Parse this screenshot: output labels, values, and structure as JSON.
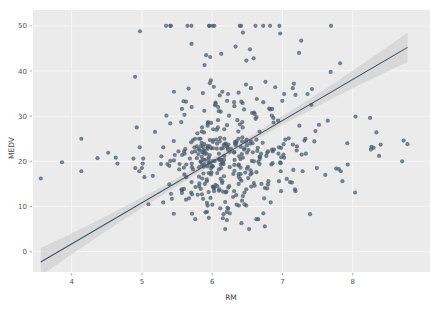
{
  "figure": {
    "background_color": "#ffffff",
    "plot_background_color": "#ebebeb",
    "gridline_color": "#f7f7f7",
    "point_color": "#4c5c6b",
    "line_color": "#45535f",
    "band_color": "#c9c9c9",
    "width": 430,
    "height": 309
  },
  "chart_data": {
    "type": "scatter",
    "title": "",
    "subtitle": "",
    "xlabel": "RM",
    "ylabel": "MEDV",
    "xlim": [
      3.45,
      9.1
    ],
    "ylim": [
      -4.5,
      53.5
    ],
    "xticks": [
      4,
      5,
      6,
      7,
      8
    ],
    "xticklabels": [
      "4",
      "5",
      "6",
      "7",
      "8"
    ],
    "yticks": [
      0,
      10,
      20,
      30,
      40,
      50
    ],
    "yticklabels": [
      "0",
      "10",
      "20",
      "30",
      "40",
      "50"
    ],
    "grid": true,
    "legend": "none",
    "regression": {
      "type": "linear",
      "slope": 9.1,
      "intercept": -34.67,
      "confidence_band": 0.95,
      "band_half_width_at_xmin": 3.1,
      "band_half_width_at_center": 0.75,
      "band_half_width_at_xmax": 3.3,
      "x_start": 3.56,
      "x_end": 8.78
    },
    "point_opacity": 0.75,
    "point_radius": 2.1,
    "n_points": 506,
    "x": [
      6.575,
      6.421,
      7.185,
      6.998,
      7.147,
      6.43,
      6.012,
      6.172,
      5.631,
      6.004,
      6.377,
      6.009,
      5.889,
      5.949,
      6.096,
      5.834,
      5.935,
      5.99,
      5.456,
      5.727,
      5.57,
      5.965,
      6.142,
      5.813,
      5.924,
      5.599,
      5.813,
      6.047,
      6.495,
      6.674,
      5.713,
      6.072,
      5.95,
      5.701,
      6.096,
      5.933,
      5.841,
      5.85,
      5.966,
      6.595,
      7.024,
      6.674,
      6.43,
      6.012,
      6.172,
      5.631,
      6.004,
      6.377,
      6.009,
      5.889,
      5.949,
      6.096,
      5.834,
      5.935,
      5.99,
      5.456,
      5.727,
      5.57,
      5.965,
      6.142,
      5.813,
      5.924,
      5.599,
      5.813,
      6.047,
      6.495,
      6.674,
      5.713,
      6.072,
      5.95,
      5.701,
      6.096,
      5.933,
      5.841,
      5.85,
      5.966,
      6.595,
      7.024,
      6.77,
      6.169,
      6.211,
      6.069,
      6.63,
      6.458,
      6.326,
      6.372,
      5.822,
      5.757,
      6.335,
      5.942,
      6.454,
      5.857,
      6.151,
      6.174,
      5.019,
      5.403,
      5.468,
      4.903,
      6.13,
      5.628,
      4.926,
      5.186,
      5.597,
      6.122,
      5.404,
      5.012,
      5.709,
      6.129,
      6.152,
      5.272,
      6.943,
      6.066,
      6.51,
      6.25,
      7.489,
      7.802,
      8.375,
      5.854,
      6.101,
      7.929,
      5.877,
      6.319,
      6.402,
      5.875,
      5.88,
      5.572,
      6.416,
      5.859,
      6.546,
      6.02,
      6.315,
      6.86,
      6.98,
      7.765,
      6.144,
      7.155,
      6.563,
      5.604,
      6.153,
      7.831,
      6.782,
      6.556,
      7.185,
      6.951,
      6.739,
      7.178,
      6.8,
      6.604,
      7.287,
      7.107,
      7.274,
      6.975,
      7.135,
      6.162,
      7.61,
      7.853,
      8.034,
      5.891,
      6.326,
      5.783,
      6.064,
      5.344,
      5.96,
      5.404,
      5.807,
      6.375,
      5.412,
      6.182,
      5.888,
      6.642,
      5.951,
      6.373,
      6.951,
      6.164,
      6.879,
      6.618,
      8.266,
      8.725,
      8.04,
      7.163,
      7.686,
      6.552,
      5.981,
      7.412,
      8.337,
      8.247,
      6.726,
      6.086,
      6.631,
      7.358,
      6.481,
      6.606,
      6.897,
      6.095,
      6.358,
      6.393,
      5.593,
      5.605,
      6.108,
      6.226,
      6.433,
      6.718,
      6.487,
      6.438,
      6.957,
      8.259,
      6.108,
      5.876,
      7.454,
      8.704,
      7.333,
      6.842,
      7.203,
      7.52,
      8.398,
      7.327,
      7.206,
      5.56,
      7.014,
      8.297,
      7.47,
      5.92,
      5.856,
      6.24,
      6.538,
      7.691,
      6.758,
      6.854,
      7.267,
      6.826,
      6.482,
      6.812,
      7.82,
      6.968,
      7.645,
      7.923,
      7.088,
      6.453,
      6.23,
      6.209,
      6.315,
      6.565,
      6.861,
      7.148,
      6.63,
      6.127,
      6.009,
      6.678,
      6.549,
      5.79,
      6.345,
      7.041,
      6.871,
      6.59,
      6.495,
      6.982,
      7.236,
      6.616,
      7.42,
      6.849,
      6.635,
      5.972,
      4.973,
      6.122,
      6.023,
      6.266,
      6.567,
      5.705,
      5.914,
      5.782,
      6.382,
      6.113,
      6.426,
      6.376,
      6.041,
      5.708,
      6.415,
      6.312,
      6.083,
      5.868,
      6.333,
      6.144,
      5.706,
      6.031,
      6.316,
      6.31,
      6.037,
      5.869,
      5.895,
      6.059,
      5.985,
      5.968,
      7.241,
      6.54,
      6.696,
      6.874,
      6.014,
      5.898,
      6.516,
      6.939,
      6.49,
      6.579,
      5.884,
      6.728,
      5.663,
      5.936,
      6.212,
      6.395,
      6.127,
      6.112,
      6.398,
      6.251,
      5.362,
      5.803,
      8.78,
      3.561,
      4.963,
      3.863,
      4.97,
      6.683,
      7.016,
      6.216,
      5.875,
      4.906,
      4.138,
      7.313,
      6.649,
      6.794,
      6.38,
      6.223,
      6.968,
      6.545,
      5.536,
      5.52,
      4.368,
      5.277,
      4.652,
      5,
      4.88,
      5.39,
      5.713,
      6.051,
      5.036,
      6.193,
      5.887,
      6.471,
      6.405,
      5.747,
      5.453,
      5.852,
      5.987,
      6.343,
      6.404,
      5.349,
      5.531,
      5.683,
      4.138,
      5.608,
      5.617,
      6.852,
      5.757,
      6.657,
      4.628,
      5.155,
      4.519,
      6.434,
      6.782,
      5.304,
      5.957,
      6.824,
      6.411,
      6.006,
      5.648,
      6.103,
      5.565,
      5.896,
      5.837,
      6.202,
      6.193,
      6.38,
      6.348,
      6.833,
      6.425,
      6.436,
      6.208,
      6.629,
      6.461,
      6.152,
      5.935,
      5.627,
      5.818,
      6.406,
      6.219,
      6.485,
      5.854,
      6.459,
      6.341,
      6.251,
      6.185,
      6.417,
      6.749,
      6.655,
      6.297,
      7.393,
      6.728,
      6.525,
      5.976,
      5.936,
      6.301,
      6.081,
      6.701,
      6.376,
      6.317,
      6.513,
      6.209,
      5.759,
      5.952,
      6.003,
      5.926,
      5.713,
      6.167,
      6.229,
      6.437,
      6.98,
      5.427,
      6.162,
      6.484,
      5.304,
      6.185,
      6.229,
      6.242,
      6.75,
      7.061,
      5.762,
      5.871,
      6.312,
      6.114,
      5.905,
      5.454,
      5.414,
      5.093,
      5.983,
      5.983,
      5.707,
      5.926,
      5.67,
      5.39,
      5.794,
      6.019,
      5.569,
      6.027,
      6.593,
      6.12,
      6.976,
      6.794,
      6.03
    ],
    "y": [
      24,
      21.6,
      34.7,
      33.4,
      36.2,
      28.7,
      22.9,
      27.1,
      16.5,
      18.9,
      15,
      18.9,
      21.7,
      20.4,
      18.2,
      19.9,
      23.1,
      17.5,
      20.2,
      18.2,
      13.6,
      19.6,
      15.2,
      14.5,
      15.6,
      13.9,
      16.6,
      14.8,
      18.4,
      21,
      12.7,
      14.5,
      13.2,
      13.1,
      13.5,
      18.9,
      20,
      21,
      24.7,
      30.8,
      34.9,
      26.6,
      25.3,
      24.7,
      21.2,
      19.3,
      20,
      16.6,
      14.4,
      19.4,
      19.7,
      20.5,
      25,
      23.4,
      18.9,
      35.4,
      24.7,
      31.6,
      23.3,
      19.6,
      18.7,
      16,
      22.2,
      25,
      33,
      23.5,
      19.4,
      22,
      17.4,
      20.9,
      24.2,
      21.7,
      22.8,
      23.4,
      24.1,
      21.4,
      20,
      20.8,
      21.2,
      20.3,
      28,
      23.9,
      24.8,
      22.9,
      23.9,
      26.6,
      22.5,
      22.2,
      23.6,
      28.7,
      22.6,
      22,
      22.9,
      25,
      20.6,
      28.4,
      21.4,
      38.7,
      43.8,
      33.2,
      27.5,
      26.5,
      18.6,
      19.3,
      20.1,
      19.5,
      19.5,
      20.4,
      19.8,
      19.4,
      21.7,
      22.8,
      18.8,
      18.7,
      18.5,
      18.3,
      21.2,
      19.2,
      20.4,
      19.3,
      22,
      20.3,
      20.5,
      17.3,
      18.8,
      21.4,
      15.7,
      16.2,
      18,
      14.3,
      19.2,
      19.6,
      23,
      18.4,
      15.6,
      18.1,
      17.4,
      17.1,
      13.3,
      17.8,
      14,
      14.4,
      13.4,
      15.6,
      11.8,
      13.8,
      15.6,
      14.6,
      17.8,
      15.4,
      21.5,
      19.6,
      15.3,
      19.4,
      17,
      15.6,
      13.1,
      41.3,
      24.3,
      23.3,
      27,
      50,
      50,
      50,
      22.7,
      25,
      50,
      23.8,
      23.8,
      22.3,
      17.4,
      19.1,
      23.1,
      23.6,
      22.6,
      29.4,
      23.2,
      24.6,
      29.9,
      37.2,
      39.8,
      36.2,
      37.9,
      32.5,
      26.4,
      29.6,
      50,
      32,
      29.8,
      34.9,
      37,
      30.5,
      36.4,
      31.1,
      29.1,
      50,
      33.3,
      30.3,
      34.6,
      34.9,
      32.9,
      24.1,
      42.3,
      48.5,
      50,
      22.6,
      24.4,
      22.5,
      24.4,
      20,
      21.7,
      19.3,
      22.4,
      28.1,
      23.7,
      25,
      23.3,
      28.7,
      21.5,
      23,
      26.7,
      21.7,
      27.5,
      30.1,
      44.8,
      50,
      37.6,
      31.6,
      46.7,
      31.5,
      24.3,
      31.7,
      41.7,
      48.3,
      29,
      24,
      25.1,
      31.5,
      23.7,
      23.3,
      22,
      20.1,
      22.2,
      23.7,
      17.6,
      18.5,
      24.3,
      20.5,
      24.5,
      26.2,
      24.4,
      24.8,
      29.6,
      42.8,
      21.9,
      20.9,
      44,
      50,
      36,
      30.1,
      33.8,
      43.1,
      48.8,
      31,
      36.5,
      22.8,
      30.7,
      50,
      43.5,
      20.7,
      21.1,
      25.2,
      24.4,
      35.2,
      32.4,
      32,
      33.2,
      33.1,
      29.1,
      35.1,
      45.4,
      35.4,
      46,
      50,
      32.2,
      22,
      20.1,
      23.2,
      22.3,
      24.8,
      28.5,
      37.3,
      27.9,
      23.9,
      21.7,
      28.6,
      27.1,
      20.3,
      22.5,
      29,
      24.8,
      22,
      26.4,
      33.1,
      36.1,
      28.4,
      33.4,
      28.2,
      22.8,
      20.3,
      16.1,
      22.1,
      19.4,
      21.6,
      23.8,
      16.2,
      17.8,
      19.8,
      23.1,
      21,
      23.8,
      23.1,
      20.4,
      18.5,
      25,
      24.6,
      23,
      22.2,
      19.3,
      22.6,
      19.8,
      17.1,
      19.4,
      22.2,
      20.7,
      21.1,
      19.5,
      18.5,
      20.6,
      19,
      18.7,
      32.7,
      16.5,
      23.9,
      31.2,
      17.5,
      17.2,
      23.1,
      24.5,
      26.6,
      22.9,
      24.1,
      18.6,
      30.1,
      18.2,
      20.6,
      17.8,
      21.7,
      22.7,
      22.6,
      25,
      19.9,
      20.8,
      16.8,
      21.9,
      27.5,
      21.9,
      23.1,
      50,
      50,
      50,
      50,
      50,
      13.8,
      13.8,
      15,
      13.9,
      13.3,
      13.1,
      10.2,
      10.4,
      10.9,
      11.3,
      12.3,
      8.8,
      7.2,
      10.5,
      7.4,
      10.2,
      11.5,
      15.1,
      23.2,
      9.7,
      13.8,
      12.7,
      13.1,
      12.5,
      8.5,
      5,
      6.3,
      5.6,
      7.2,
      12.1,
      8.3,
      8.5,
      5,
      11.9,
      27.9,
      17.2,
      27.5,
      15,
      17.2,
      17.9,
      16.3,
      7,
      7.2,
      7.5,
      10.4,
      8.8,
      8.4,
      16.7,
      14.2,
      20.8,
      13.4,
      11.7,
      8.3,
      10.2,
      10.9,
      11,
      9.5,
      14.5,
      14.1,
      16.1,
      14.3,
      11.7,
      13.4,
      9.6,
      8.7,
      8.4,
      12.8,
      10.5,
      17.1,
      18.4,
      15.4,
      10.8,
      11.8,
      14.9,
      12.6,
      14.1,
      13,
      13.4,
      15.2,
      16.1,
      17.8,
      14.9,
      14.1,
      12.7,
      13.5,
      14.9,
      20,
      16.4,
      17.7,
      19.5,
      20.2,
      21.4,
      19.9,
      19,
      19.1,
      19.1,
      20.1,
      19.9,
      19.6,
      23.2,
      29.8,
      13.8,
      13.3,
      16.7,
      12,
      14.6,
      21.4,
      23,
      23.7,
      25,
      21.8,
      20.6,
      21.2,
      19.1,
      20.6,
      15.2,
      7,
      8.1,
      13.6,
      20.1,
      21.8,
      24.5,
      23.1,
      19.7,
      18.3,
      21.2,
      17.5,
      16.8,
      22.4,
      20.6,
      23.9,
      22,
      11.9
    ]
  },
  "axis": {
    "x_title": "RM",
    "y_title": "MEDV"
  }
}
